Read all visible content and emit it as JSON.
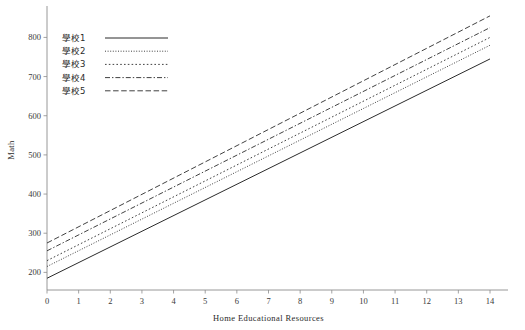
{
  "chart_title": "",
  "chart_data": {
    "type": "line",
    "title": "",
    "xlabel": "Home Educational Resources",
    "ylabel": "Math",
    "xlim": [
      0,
      14
    ],
    "ylim": [
      155,
      870
    ],
    "grid": false,
    "legend_position": "top-left",
    "xticks": [
      "0",
      "1",
      "2",
      "3",
      "4",
      "5",
      "6",
      "7",
      "8",
      "9",
      "10",
      "11",
      "12",
      "13",
      "14"
    ],
    "xtick_values": [
      0,
      1,
      2,
      3,
      4,
      5,
      6,
      7,
      8,
      9,
      10,
      11,
      12,
      13,
      14
    ],
    "yticks": [
      "200",
      "300",
      "400",
      "500",
      "600",
      "700",
      "800"
    ],
    "ytick_values": [
      200,
      300,
      400,
      500,
      600,
      700,
      800
    ],
    "x": [
      0,
      14
    ],
    "series": [
      {
        "name": "學校1",
        "values": [
          185,
          745
        ],
        "style": "solid",
        "dash": "none",
        "width": 1.0
      },
      {
        "name": "學校2",
        "values": [
          215,
          780
        ],
        "style": "fine-dotted",
        "dash": "1,1.6",
        "width": 0.9
      },
      {
        "name": "學校3",
        "values": [
          230,
          800
        ],
        "style": "dotted",
        "dash": "1.6,2.2",
        "width": 0.9
      },
      {
        "name": "學校4",
        "values": [
          255,
          825
        ],
        "style": "dash-dot",
        "dash": "5,2,1.4,2",
        "width": 0.9
      },
      {
        "name": "學校5",
        "values": [
          275,
          855
        ],
        "style": "dashed",
        "dash": "5.5,2.6",
        "width": 0.9
      }
    ]
  },
  "legend": {
    "entries": [
      {
        "label": "學校1"
      },
      {
        "label": "學校2"
      },
      {
        "label": "學校3"
      },
      {
        "label": "學校4"
      },
      {
        "label": "學校5"
      }
    ]
  }
}
